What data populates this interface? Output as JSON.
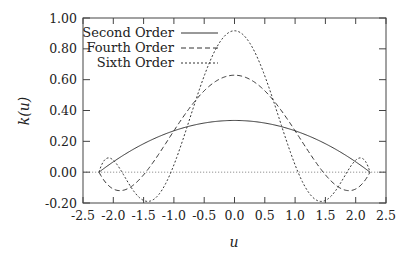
{
  "chart_data": {
    "type": "line",
    "title": "",
    "xlabel": "u",
    "ylabel": "k(u)",
    "xlim": [
      -2.5,
      2.5
    ],
    "ylim": [
      -0.2,
      1.0
    ],
    "xticks": [
      "-2.5",
      "-2.0",
      "-1.5",
      "-1.0",
      "-0.5",
      "0.0",
      "0.5",
      "1.0",
      "1.5",
      "2.0",
      "2.5"
    ],
    "yticks": [
      "-0.20",
      "0.00",
      "0.20",
      "0.40",
      "0.60",
      "0.80",
      "1.00"
    ],
    "grid": false,
    "legend_position": "top-left",
    "support": [
      -2.236,
      2.236
    ],
    "series": [
      {
        "name": "Second Order",
        "style": "solid",
        "peak": 0.335,
        "x": [
          -2.236,
          -2.0,
          -1.5,
          -1.0,
          -0.5,
          0.0,
          0.5,
          1.0,
          1.5,
          2.0,
          2.236
        ],
        "values": [
          0.0,
          0.067,
          0.184,
          0.268,
          0.318,
          0.335,
          0.318,
          0.268,
          0.184,
          0.067,
          0.0
        ]
      },
      {
        "name": "Fourth Order",
        "style": "dashed",
        "peak": 0.629,
        "x": [
          -2.236,
          -2.0,
          -1.5,
          -1.0,
          -0.5,
          0.0,
          0.5,
          1.0,
          1.5,
          2.0,
          2.236
        ],
        "values": [
          0.0,
          -0.127,
          -0.01,
          0.335,
          0.582,
          0.629,
          0.582,
          0.335,
          -0.01,
          -0.127,
          0.0
        ]
      },
      {
        "name": "Sixth Order",
        "style": "dotted",
        "peak": 0.917,
        "x": [
          -2.236,
          -2.0,
          -1.5,
          -1.0,
          -0.5,
          0.0,
          0.5,
          1.0,
          1.5,
          2.0,
          2.236
        ],
        "values": [
          0.0,
          0.056,
          -0.199,
          0.032,
          0.753,
          0.917,
          0.753,
          0.032,
          -0.199,
          0.056,
          0.0
        ]
      }
    ]
  },
  "legend": {
    "items": [
      "Second Order",
      "Fourth Order",
      "Sixth Order"
    ]
  },
  "axes": {
    "xlabel": "u",
    "ylabel": "k(u)"
  }
}
